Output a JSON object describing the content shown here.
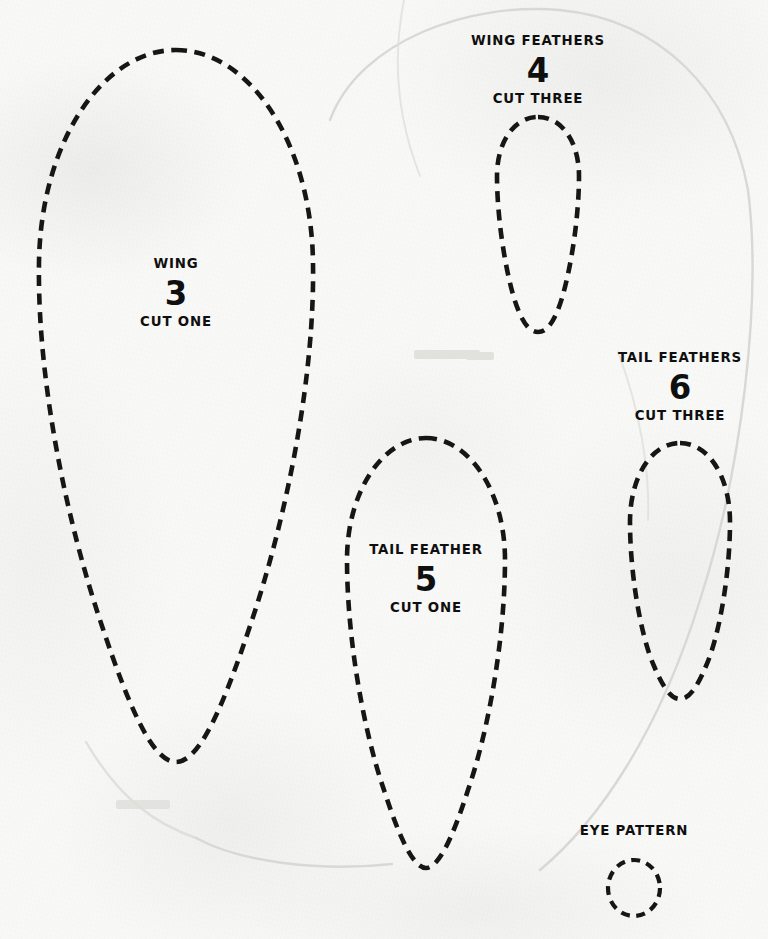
{
  "sheet": {
    "kind": "sewing-pattern-sheet",
    "paper_color": "#f8f8f7",
    "ink_color": "#161616",
    "width": 768,
    "height": 939
  },
  "pieces": [
    {
      "id": "wing",
      "title": "WING",
      "number": "3",
      "cut": "CUT ONE",
      "shape": "teardrop"
    },
    {
      "id": "wing-feathers",
      "title": "WING FEATHERS",
      "number": "4",
      "cut": "CUT THREE",
      "shape": "teardrop"
    },
    {
      "id": "tail-feather",
      "title": "TAIL FEATHER",
      "number": "5",
      "cut": "CUT ONE",
      "shape": "teardrop"
    },
    {
      "id": "tail-feathers",
      "title": "TAIL FEATHERS",
      "number": "6",
      "cut": "CUT THREE",
      "shape": "teardrop"
    },
    {
      "id": "eye-pattern",
      "title": "EYE PATTERN",
      "number": "",
      "cut": "",
      "shape": "ellipse"
    }
  ]
}
